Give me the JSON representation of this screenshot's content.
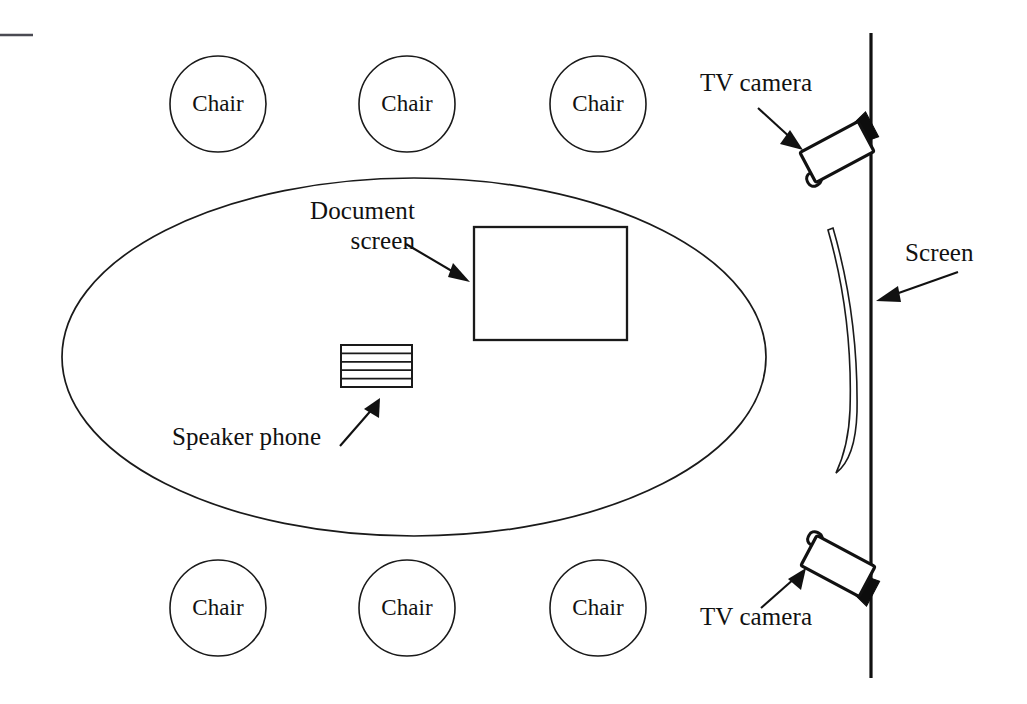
{
  "diagram": {
    "background_color": "#ffffff",
    "ink_color": "#111111",
    "width": 1027,
    "height": 704
  },
  "chairs": [
    {
      "label": "Chair",
      "cx": 218,
      "cy": 104,
      "r": 48,
      "position": "top-left"
    },
    {
      "label": "Chair",
      "cx": 407,
      "cy": 104,
      "r": 48,
      "position": "top-center"
    },
    {
      "label": "Chair",
      "cx": 598,
      "cy": 104,
      "r": 48,
      "position": "top-right"
    },
    {
      "label": "Chair",
      "cx": 218,
      "cy": 608,
      "r": 48,
      "position": "bottom-left"
    },
    {
      "label": "Chair",
      "cx": 407,
      "cy": 608,
      "r": 48,
      "position": "bottom-center"
    },
    {
      "label": "Chair",
      "cx": 598,
      "cy": 608,
      "r": 48,
      "position": "bottom-right"
    }
  ],
  "table": {
    "name": "conference-table",
    "shape": "ellipse",
    "cx": 414,
    "cy": 357,
    "rx": 352,
    "ry": 179
  },
  "document_screen": {
    "label_line1": "Document",
    "label_line2": "screen",
    "rect": {
      "x": 474,
      "y": 227,
      "w": 153,
      "h": 113
    }
  },
  "speaker_phone": {
    "label": "Speaker phone",
    "rect": {
      "x": 341,
      "y": 345,
      "w": 71,
      "h": 42
    },
    "band_count": 5
  },
  "wall": {
    "name": "room-wall",
    "x": 871,
    "y_top": 33,
    "y_bottom": 678
  },
  "corner_mark": {
    "x1": 0,
    "x2": 33,
    "y": 35
  },
  "screen": {
    "label": "Screen",
    "shape": "curved-projection-screen",
    "top_y": 227,
    "bottom_y": 474,
    "bulge_x": 857
  },
  "cameras": [
    {
      "label": "TV camera",
      "position": "top",
      "cx": 837,
      "cy": 152,
      "angle_deg": -28
    },
    {
      "label": "TV camera",
      "position": "bottom",
      "cx": 838,
      "cy": 566,
      "angle_deg": 28
    }
  ],
  "labels": {
    "tv_camera_top": "TV camera",
    "tv_camera_bottom": "TV camera",
    "screen": "Screen",
    "document_screen_line1": "Document",
    "document_screen_line2": "screen",
    "speaker_phone": "Speaker phone",
    "chair": "Chair"
  }
}
